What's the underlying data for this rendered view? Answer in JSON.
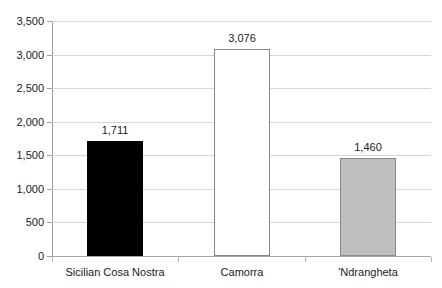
{
  "chart_data": {
    "type": "bar",
    "title": "",
    "subtitle": "",
    "xlabel": "",
    "ylabel": "",
    "categories": [
      "Sicilian Cosa Nostra",
      "Camorra",
      "'Ndrangheta"
    ],
    "values": [
      1711,
      3076,
      1460
    ],
    "value_labels": [
      "1,711",
      "3,076",
      "1,460"
    ],
    "bar_colors": [
      "#000000",
      "#FFFFFF",
      "#BFBFBF"
    ],
    "bar_border_colors": [
      "#000000",
      "#868686",
      "#8A8A8A"
    ],
    "ylim": [
      0,
      3500
    ],
    "ytick_step": 500,
    "ytick_labels": [
      "0",
      "500",
      "1,000",
      "1,500",
      "2,000",
      "2,500",
      "3,000",
      "3,500"
    ],
    "ytick_values": [
      0,
      500,
      1000,
      1500,
      2000,
      2500,
      3000,
      3500
    ],
    "grid": true,
    "grid_color": "#D6D6D6",
    "axis_color": "#9D9D9D",
    "legend": false,
    "legend_position": "none",
    "background": "#FFFFFF"
  }
}
